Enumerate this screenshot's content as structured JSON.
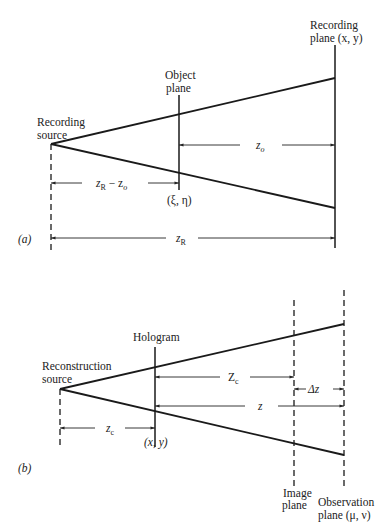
{
  "figure": {
    "part_a": {
      "tag": "(a)",
      "source_label_1": "Recording",
      "source_label_2": "source",
      "object_plane_label_1": "Object",
      "object_plane_label_2": "plane",
      "object_coords": "(ξ, η)",
      "recording_plane_label_1": "Recording",
      "recording_plane_label_2": "plane (x, y)",
      "dim_zo": "z",
      "dim_zo_sub": "o",
      "dim_zr_minus_zo": "z",
      "dim_zr_minus_zo_sub1": "R",
      "dim_zr_minus_zo_mid": " − z",
      "dim_zr_minus_zo_sub2": "o",
      "dim_zr": "z",
      "dim_zr_sub": "R"
    },
    "part_b": {
      "tag": "(b)",
      "source_label_1": "Reconstruction",
      "source_label_2": "source",
      "hologram_label": "Hologram",
      "hologram_coords": "(x, y)",
      "image_plane_label_1": "Image",
      "image_plane_label_2": "plane",
      "observation_plane_label_1": "Observation",
      "observation_plane_label_2": "plane (μ, ν)",
      "dim_Zc": "Z",
      "dim_Zc_sub": "c",
      "dim_delta_z": "Δz",
      "dim_z": "z",
      "dim_zc": "z",
      "dim_zc_sub": "c"
    }
  }
}
